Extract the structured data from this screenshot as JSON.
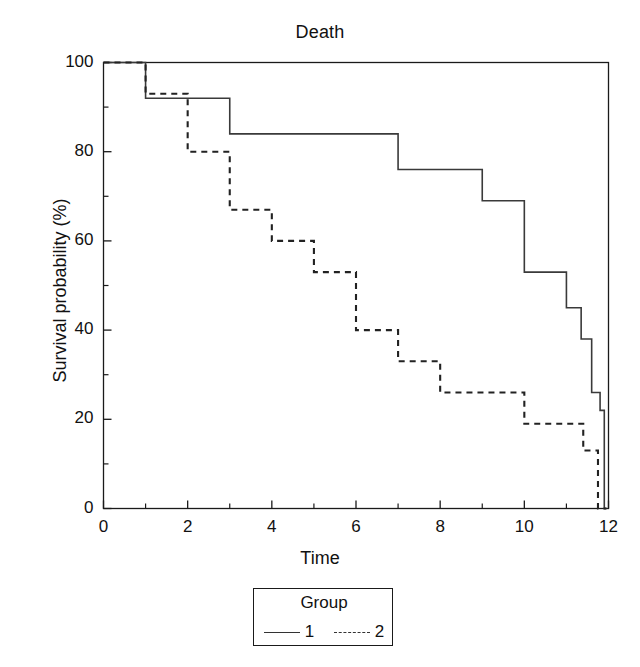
{
  "chart_data": {
    "type": "line",
    "subtype": "kaplan-meier-step",
    "title": "Death",
    "xlabel": "Time",
    "ylabel": "Survival probability (%)",
    "xlim": [
      0,
      12
    ],
    "ylim": [
      0,
      100
    ],
    "grid": false,
    "x_major_ticks": [
      0,
      2,
      4,
      6,
      8,
      10,
      12
    ],
    "x_minor_ticks": [
      1,
      3,
      5,
      7,
      9,
      11
    ],
    "x_tick_labels": [
      "0",
      "2",
      "4",
      "6",
      "8",
      "10",
      "12"
    ],
    "y_major_ticks": [
      0,
      20,
      40,
      60,
      80,
      100
    ],
    "y_minor_ticks": [
      10,
      30,
      50,
      70,
      90
    ],
    "y_tick_labels": [
      "0",
      "20",
      "40",
      "60",
      "80",
      "100"
    ],
    "legend": {
      "title": "Group",
      "position": "below-center",
      "entries": [
        {
          "label": "1",
          "style": "solid"
        },
        {
          "label": "2",
          "style": "dashed"
        }
      ]
    },
    "series": [
      {
        "name": "1",
        "style": "solid",
        "color": "#3a3a3a",
        "points": [
          {
            "x": 0,
            "y": 100
          },
          {
            "x": 1,
            "y": 100
          },
          {
            "x": 1,
            "y": 92
          },
          {
            "x": 3,
            "y": 92
          },
          {
            "x": 3,
            "y": 84
          },
          {
            "x": 7,
            "y": 84
          },
          {
            "x": 7,
            "y": 76
          },
          {
            "x": 9,
            "y": 76
          },
          {
            "x": 9,
            "y": 69
          },
          {
            "x": 10,
            "y": 69
          },
          {
            "x": 10,
            "y": 53
          },
          {
            "x": 11,
            "y": 53
          },
          {
            "x": 11,
            "y": 45
          },
          {
            "x": 11.35,
            "y": 45
          },
          {
            "x": 11.35,
            "y": 38
          },
          {
            "x": 11.6,
            "y": 38
          },
          {
            "x": 11.6,
            "y": 26
          },
          {
            "x": 11.8,
            "y": 26
          },
          {
            "x": 11.8,
            "y": 22
          },
          {
            "x": 11.9,
            "y": 22
          },
          {
            "x": 11.9,
            "y": 0
          },
          {
            "x": 11.95,
            "y": 0
          }
        ]
      },
      {
        "name": "2",
        "style": "dashed",
        "color": "#222222",
        "points": [
          {
            "x": 0,
            "y": 100
          },
          {
            "x": 1,
            "y": 100
          },
          {
            "x": 1,
            "y": 93
          },
          {
            "x": 2,
            "y": 93
          },
          {
            "x": 2,
            "y": 80
          },
          {
            "x": 3,
            "y": 80
          },
          {
            "x": 3,
            "y": 67
          },
          {
            "x": 4,
            "y": 67
          },
          {
            "x": 4,
            "y": 60
          },
          {
            "x": 5,
            "y": 60
          },
          {
            "x": 5,
            "y": 53
          },
          {
            "x": 6,
            "y": 53
          },
          {
            "x": 6,
            "y": 40
          },
          {
            "x": 7,
            "y": 40
          },
          {
            "x": 7,
            "y": 33
          },
          {
            "x": 8,
            "y": 33
          },
          {
            "x": 8,
            "y": 26
          },
          {
            "x": 10,
            "y": 26
          },
          {
            "x": 10,
            "y": 19
          },
          {
            "x": 11.4,
            "y": 19
          },
          {
            "x": 11.4,
            "y": 13
          },
          {
            "x": 11.75,
            "y": 13
          },
          {
            "x": 11.75,
            "y": 0
          },
          {
            "x": 11.95,
            "y": 0
          }
        ]
      }
    ]
  }
}
